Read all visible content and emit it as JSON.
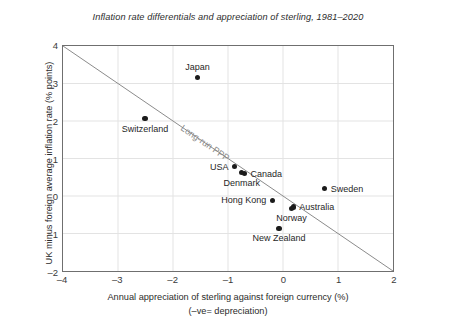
{
  "chart_data": {
    "type": "scatter",
    "title": "Inflation rate differentials and appreciation of sterling, 1981–2020",
    "xlabel": "Annual appreciation of sterling against foreign currency (%)",
    "xlabel_sub": "(–ve= depreciation)",
    "ylabel": "UK minus foreign average inflation rate (% points)",
    "xlim": [
      -4,
      2
    ],
    "ylim": [
      -2,
      4
    ],
    "xticks": [
      "–4",
      "–3",
      "–2",
      "–1",
      "0",
      "1",
      "2"
    ],
    "xtick_values": [
      -4,
      -3,
      -2,
      -1,
      0,
      1,
      2
    ],
    "yticks": [
      "–2",
      "–1",
      "0",
      "1",
      "2",
      "3",
      "4"
    ],
    "ytick_values": [
      -2,
      -1,
      0,
      1,
      2,
      3,
      4
    ],
    "grid": true,
    "legend": "none",
    "trendline": {
      "label": "Long-run PPP",
      "from": [
        -4,
        4
      ],
      "to": [
        2,
        -2
      ],
      "slope": -1,
      "intercept": 0,
      "color": "#8a8a8a"
    },
    "point_color": "#1b1b1b",
    "points": [
      {
        "name": "Japan",
        "x": -1.55,
        "y": 3.15,
        "label_pos": "above"
      },
      {
        "name": "Switzerland",
        "x": -2.5,
        "y": 2.05,
        "label_pos": "below"
      },
      {
        "name": "USA",
        "x": -0.88,
        "y": 0.78,
        "label_pos": "left"
      },
      {
        "name": "Canada",
        "x": -0.7,
        "y": 0.6,
        "label_pos": "right"
      },
      {
        "name": "Denmark",
        "x": -0.75,
        "y": 0.62,
        "label_pos": "below"
      },
      {
        "name": "Hong Kong",
        "x": -0.2,
        "y": -0.1,
        "label_pos": "left"
      },
      {
        "name": "Australia",
        "x": 0.18,
        "y": -0.28,
        "label_pos": "right"
      },
      {
        "name": "Norway",
        "x": 0.15,
        "y": -0.32,
        "label_pos": "below"
      },
      {
        "name": "Sweden",
        "x": 0.75,
        "y": 0.2,
        "label_pos": "right"
      },
      {
        "name": "New Zealand",
        "x": -0.08,
        "y": -0.85,
        "label_pos": "below"
      }
    ]
  }
}
